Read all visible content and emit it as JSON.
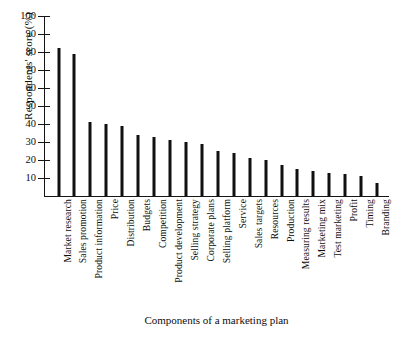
{
  "chart_data": {
    "type": "bar",
    "title": "",
    "xlabel": "Components of a marketing plan",
    "ylabel": "Respondents' score (%)",
    "ylim": [
      0,
      100
    ],
    "yticks": [
      10,
      20,
      30,
      40,
      50,
      60,
      70,
      80,
      90,
      100
    ],
    "grid": false,
    "legend": "none",
    "orientation": "vertical",
    "categories": [
      "Market research",
      "Sales promotion",
      "Product information",
      "Price",
      "Distribution",
      "Budgets",
      "Competition",
      "Product development",
      "Selling strategy",
      "Corporate plans",
      "Selling platform",
      "Service",
      "Sales targets",
      "Resources",
      "Production",
      "Measuring results",
      "Marketing mix",
      "Test marketing",
      "Profit",
      "Timing",
      "Branding"
    ],
    "values": [
      82,
      79,
      41,
      40,
      39,
      34,
      33,
      31,
      30,
      29,
      25,
      24,
      21,
      20,
      17,
      15,
      14,
      13,
      12,
      11,
      7
    ]
  },
  "axis": {
    "y_top_label": "100",
    "y_bottom_label": "10"
  }
}
